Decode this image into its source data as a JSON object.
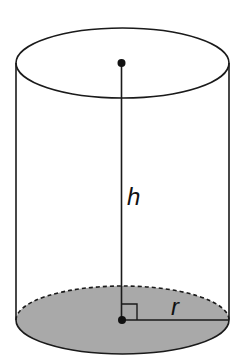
{
  "diagram": {
    "shape": "cylinder",
    "labels": {
      "height": "h",
      "radius": "r"
    },
    "colors": {
      "stroke": "#1a1a1a",
      "base_fill": "#a9a9a9",
      "background": "#ffffff"
    },
    "annotations": [
      "top-center-point",
      "bottom-center-point",
      "height-segment",
      "radius-segment",
      "right-angle-marker",
      "hidden-edge-dashed"
    ]
  }
}
